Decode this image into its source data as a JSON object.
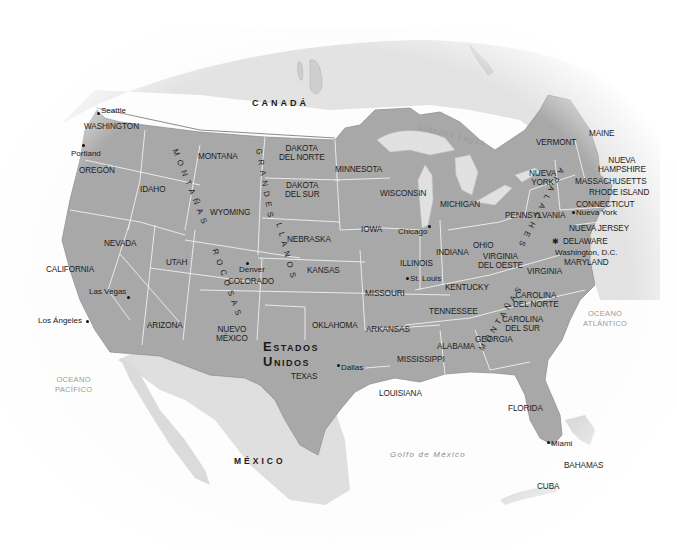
{
  "map": {
    "title": "Estados Unidos",
    "colors": {
      "usa_fill": "#a9a9a9",
      "neighbor_fill": "#e2e2e2",
      "water": "#efefef",
      "borders": "#f4f4f4",
      "text": "#1d1d1d",
      "ocean_text": "#9a9a9a"
    },
    "countries": {
      "usa_line1": "Estados",
      "usa_line2": "Unidos",
      "canada": "CANADÁ",
      "mexico": "MÉXICO",
      "bahamas": "BAHAMAS",
      "cuba": "CUBA"
    },
    "water_bodies": {
      "pacific_line1": "OCEANO",
      "pacific_line2": "PACÍFICO",
      "atlantic_line1": "OCEANO",
      "atlantic_line2": "ATLÁNTICO",
      "gulf": "Golfo de México",
      "great_lakes": "Grandes Lagos"
    },
    "physical": {
      "rockies_upper": "MONTAÑAS",
      "rockies_lower": "ROCOSAS",
      "plains_upper": "GRANDES",
      "plains_lower": "LLANOS",
      "appalachians_upper": "APALACHES",
      "appalachians_lower": "MONTAÑAS"
    },
    "states": [
      {
        "id": "washington",
        "label": "WASHINGTON"
      },
      {
        "id": "oregon",
        "label": "OREGÓN"
      },
      {
        "id": "california",
        "label": "CALIFORNIA"
      },
      {
        "id": "nevada",
        "label": "NEVADA"
      },
      {
        "id": "idaho",
        "label": "IDAHO"
      },
      {
        "id": "montana",
        "label": "MONTANA"
      },
      {
        "id": "wyoming",
        "label": "WYOMING"
      },
      {
        "id": "utah",
        "label": "UTAH"
      },
      {
        "id": "arizona",
        "label": "ARIZONA"
      },
      {
        "id": "colorado",
        "label": "COLORADO"
      },
      {
        "id": "nuevo_mexico_1",
        "label": "NUEVO"
      },
      {
        "id": "nuevo_mexico_2",
        "label": "MÉXICO"
      },
      {
        "id": "dakota_norte_1",
        "label": "DAKOTA"
      },
      {
        "id": "dakota_norte_2",
        "label": "DEL NORTE"
      },
      {
        "id": "dakota_sur_1",
        "label": "DAKOTA"
      },
      {
        "id": "dakota_sur_2",
        "label": "DEL SUR"
      },
      {
        "id": "nebraska",
        "label": "NEBRASKA"
      },
      {
        "id": "kansas",
        "label": "KANSAS"
      },
      {
        "id": "oklahoma",
        "label": "OKLAHOMA"
      },
      {
        "id": "texas",
        "label": "TEXAS"
      },
      {
        "id": "minnesota",
        "label": "MINNESOTA"
      },
      {
        "id": "iowa",
        "label": "IOWA"
      },
      {
        "id": "missouri",
        "label": "MISSOURI"
      },
      {
        "id": "arkansas",
        "label": "ARKANSAS"
      },
      {
        "id": "louisiana",
        "label": "LOUISIANA"
      },
      {
        "id": "wisconsin",
        "label": "WISCONSIN"
      },
      {
        "id": "illinois",
        "label": "ILLINOIS"
      },
      {
        "id": "mississippi",
        "label": "MISSISSIPPI"
      },
      {
        "id": "michigan",
        "label": "MICHIGAN"
      },
      {
        "id": "indiana",
        "label": "INDIANA"
      },
      {
        "id": "kentucky",
        "label": "KENTUCKY"
      },
      {
        "id": "tennessee",
        "label": "TENNESSEE"
      },
      {
        "id": "alabama",
        "label": "ALABAMA"
      },
      {
        "id": "ohio",
        "label": "OHIO"
      },
      {
        "id": "georgia",
        "label": "GEORGIA"
      },
      {
        "id": "florida",
        "label": "FLORIDA"
      },
      {
        "id": "virginia_oeste_1",
        "label": "VIRGINIA"
      },
      {
        "id": "virginia_oeste_2",
        "label": "DEL OESTE"
      },
      {
        "id": "virginia",
        "label": "VIRGINIA"
      },
      {
        "id": "carolina_norte_1",
        "label": "CAROLINA"
      },
      {
        "id": "carolina_norte_2",
        "label": "DEL NORTE"
      },
      {
        "id": "carolina_sur_1",
        "label": "CAROLINA"
      },
      {
        "id": "carolina_sur_2",
        "label": "DEL SUR"
      },
      {
        "id": "pennsylvania",
        "label": "PENNSYLVANIA"
      },
      {
        "id": "nueva_york_1",
        "label": "NUEVA"
      },
      {
        "id": "nueva_york_2",
        "label": "YORK"
      },
      {
        "id": "nueva_jersey",
        "label": "NUEVA JERSEY"
      },
      {
        "id": "delaware",
        "label": "DELAWARE"
      },
      {
        "id": "maryland",
        "label": "MARYLAND"
      },
      {
        "id": "connecticut",
        "label": "CONNECTICUT"
      },
      {
        "id": "rhode_island",
        "label": "RHODE ISLAND"
      },
      {
        "id": "massachusetts",
        "label": "MASSACHUSETTS"
      },
      {
        "id": "vermont",
        "label": "VERMONT"
      },
      {
        "id": "nueva_hampshire_1",
        "label": "NUEVA"
      },
      {
        "id": "nueva_hampshire_2",
        "label": "HAMPSHIRE"
      },
      {
        "id": "maine",
        "label": "MAINE"
      }
    ],
    "cities": [
      {
        "id": "seattle",
        "label": "Seattle"
      },
      {
        "id": "portland",
        "label": "Portland"
      },
      {
        "id": "las_vegas",
        "label": "Las Vegas"
      },
      {
        "id": "los_angeles",
        "label": "Los Ángeles"
      },
      {
        "id": "denver",
        "label": "Denver"
      },
      {
        "id": "dallas",
        "label": "Dallas"
      },
      {
        "id": "chicago",
        "label": "Chicago"
      },
      {
        "id": "st_louis",
        "label": "St. Louis"
      },
      {
        "id": "nueva_york",
        "label": "Nueva York"
      },
      {
        "id": "washington_dc",
        "label": "Washington, D.C."
      },
      {
        "id": "miami",
        "label": "Miami"
      }
    ]
  }
}
